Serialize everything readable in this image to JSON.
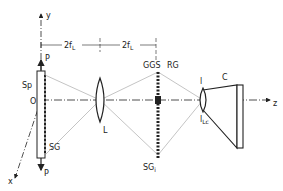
{
  "diagram": {
    "type": "optical-setup",
    "axes": {
      "y": "y",
      "z": "z",
      "x": "x",
      "origin": "O"
    },
    "dimensions": [
      {
        "label": "2f",
        "sub": "L",
        "from": "specimen",
        "to": "lens"
      },
      {
        "label": "2f",
        "sub": "L",
        "from": "lens",
        "to": "image-grating"
      }
    ],
    "components": {
      "load_top": "P",
      "load_bottom": "P",
      "specimen": "Sp",
      "specimen_grating": "SG",
      "lens": "L",
      "image_grating": "SG",
      "image_grating_sub": "i",
      "ggs": "GGS",
      "reference_grating": "RG",
      "camera_lens": "l",
      "camera_lens_sub": "Lc",
      "camera": "C"
    },
    "colors": {
      "line": "#222222",
      "ray": "#888888",
      "background": "#ffffff"
    }
  }
}
